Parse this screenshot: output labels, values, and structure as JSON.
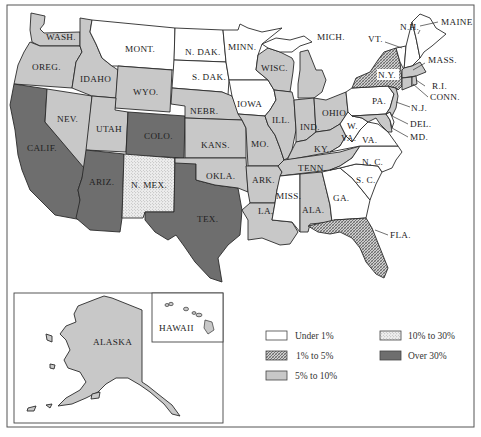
{
  "colors": {
    "under_1": "#ffffff",
    "p1_to_5": "#9a9a9a",
    "p5_to_10": "#c8c8c8",
    "p10_to_30": "#e4e4e4",
    "over_30": "#6e6e6e",
    "ink": "#2a2a2a"
  },
  "legend": {
    "items": [
      {
        "key": "under_1",
        "label": "Under 1%",
        "pattern": "none"
      },
      {
        "key": "p1_to_5",
        "label": "1% to 5%",
        "pattern": "crosshatch"
      },
      {
        "key": "p5_to_10",
        "label": "5% to 10%",
        "pattern": "solid-light-gray"
      },
      {
        "key": "p10_to_30",
        "label": "10% to 30%",
        "pattern": "stipple"
      },
      {
        "key": "over_30",
        "label": "Over 30%",
        "pattern": "solid-dark-gray"
      }
    ]
  },
  "insets": {
    "alaska": {
      "label": "ALASKA",
      "category": "p5_to_10"
    },
    "hawaii": {
      "label": "HAWAII",
      "category": "p5_to_10"
    }
  },
  "states": [
    {
      "abbr": "WASH.",
      "category": "p5_to_10"
    },
    {
      "abbr": "OREG.",
      "category": "p5_to_10"
    },
    {
      "abbr": "CALIF.",
      "category": "over_30"
    },
    {
      "abbr": "NEV.",
      "category": "p5_to_10"
    },
    {
      "abbr": "IDAHO",
      "category": "p5_to_10"
    },
    {
      "abbr": "MONT.",
      "category": "under_1"
    },
    {
      "abbr": "WYO.",
      "category": "p5_to_10"
    },
    {
      "abbr": "UTAH",
      "category": "p5_to_10"
    },
    {
      "abbr": "COLO.",
      "category": "over_30"
    },
    {
      "abbr": "ARIZ.",
      "category": "over_30"
    },
    {
      "abbr": "N. MEX.",
      "category": "p10_to_30"
    },
    {
      "abbr": "TEX.",
      "category": "over_30"
    },
    {
      "abbr": "N. DAK.",
      "category": "under_1"
    },
    {
      "abbr": "S. DAK.",
      "category": "under_1"
    },
    {
      "abbr": "NEBR.",
      "category": "p5_to_10"
    },
    {
      "abbr": "KANS.",
      "category": "p5_to_10"
    },
    {
      "abbr": "OKLA.",
      "category": "p5_to_10"
    },
    {
      "abbr": "MINN.",
      "category": "under_1"
    },
    {
      "abbr": "IOWA",
      "category": "under_1"
    },
    {
      "abbr": "MO.",
      "category": "p5_to_10"
    },
    {
      "abbr": "ARK.",
      "category": "p5_to_10"
    },
    {
      "abbr": "LA.",
      "category": "p5_to_10"
    },
    {
      "abbr": "WISC.",
      "category": "p5_to_10"
    },
    {
      "abbr": "ILL.",
      "category": "p5_to_10"
    },
    {
      "abbr": "MICH.",
      "category": "p5_to_10"
    },
    {
      "abbr": "IND.",
      "category": "p5_to_10"
    },
    {
      "abbr": "OHIO",
      "category": "p5_to_10"
    },
    {
      "abbr": "KY.",
      "category": "p5_to_10"
    },
    {
      "abbr": "TENN.",
      "category": "p5_to_10"
    },
    {
      "abbr": "MISS.",
      "category": "under_1"
    },
    {
      "abbr": "ALA.",
      "category": "p5_to_10"
    },
    {
      "abbr": "GA.",
      "category": "under_1"
    },
    {
      "abbr": "FLA.",
      "category": "p1_to_5"
    },
    {
      "abbr": "S. C.",
      "category": "under_1"
    },
    {
      "abbr": "N. C.",
      "category": "under_1"
    },
    {
      "abbr": "VA.",
      "category": "under_1"
    },
    {
      "abbr": "W. VA.",
      "category": "under_1"
    },
    {
      "abbr": "MD.",
      "category": "p5_to_10"
    },
    {
      "abbr": "DEL.",
      "category": "under_1"
    },
    {
      "abbr": "PA.",
      "category": "under_1"
    },
    {
      "abbr": "N.J.",
      "category": "p5_to_10"
    },
    {
      "abbr": "N.Y.",
      "category": "p1_to_5"
    },
    {
      "abbr": "CONN.",
      "category": "p5_to_10"
    },
    {
      "abbr": "R.I.",
      "category": "p5_to_10"
    },
    {
      "abbr": "MASS.",
      "category": "p5_to_10"
    },
    {
      "abbr": "VT.",
      "category": "under_1"
    },
    {
      "abbr": "N.H.",
      "category": "under_1"
    },
    {
      "abbr": "MAINE",
      "category": "under_1"
    }
  ]
}
